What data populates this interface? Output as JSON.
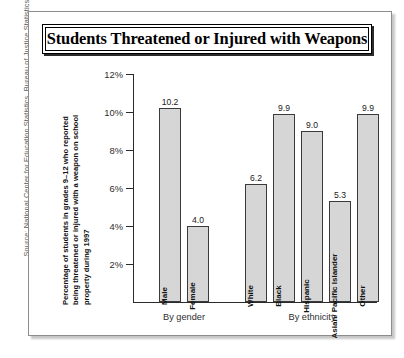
{
  "source_note": "Source: National Center for Education Statistics, Bureau of Justice Statistics, 1997.",
  "title": "Students Threatened or Injured with Weapons",
  "y_axis_title_lines": [
    "Percentage of students in grades 9–12 who reported",
    "being threatened or injured with a weapon on school",
    "property during 1997"
  ],
  "chart_data": {
    "type": "bar",
    "title": "Students Threatened or Injured with Weapons",
    "xlabel": "",
    "ylabel": "Percentage of students in grades 9–12 who reported being threatened or injured with a weapon on school property during 1997",
    "ylim": [
      0,
      12
    ],
    "ytick_labels": [
      "2%",
      "4%",
      "6%",
      "8%",
      "10%",
      "12%"
    ],
    "ytick_values": [
      2,
      4,
      6,
      8,
      10,
      12
    ],
    "grid": false,
    "legend": "none",
    "value_label_format": "one-decimal",
    "groups": [
      {
        "name": "By gender",
        "categories": [
          "Male",
          "Female"
        ],
        "values": [
          10.2,
          4.0
        ],
        "value_labels": [
          "10.2",
          "4.0"
        ]
      },
      {
        "name": "By ethnicity",
        "categories": [
          "White",
          "Black",
          "Hispanic",
          "Asian/ Pacific Islander",
          "Other"
        ],
        "values": [
          6.2,
          9.9,
          9.0,
          5.3,
          9.9
        ],
        "value_labels": [
          "6.2",
          "9.9",
          "9.0",
          "5.3",
          "9.9"
        ]
      }
    ],
    "categories": [
      "Male",
      "Female",
      "White",
      "Black",
      "Hispanic",
      "Asian/ Pacific Islander",
      "Other"
    ],
    "values": [
      10.2,
      4.0,
      6.2,
      9.9,
      9.0,
      5.3,
      9.9
    ],
    "bar_fill_color": "#d6d6d6",
    "bar_border_color": "#3a3a3a"
  }
}
